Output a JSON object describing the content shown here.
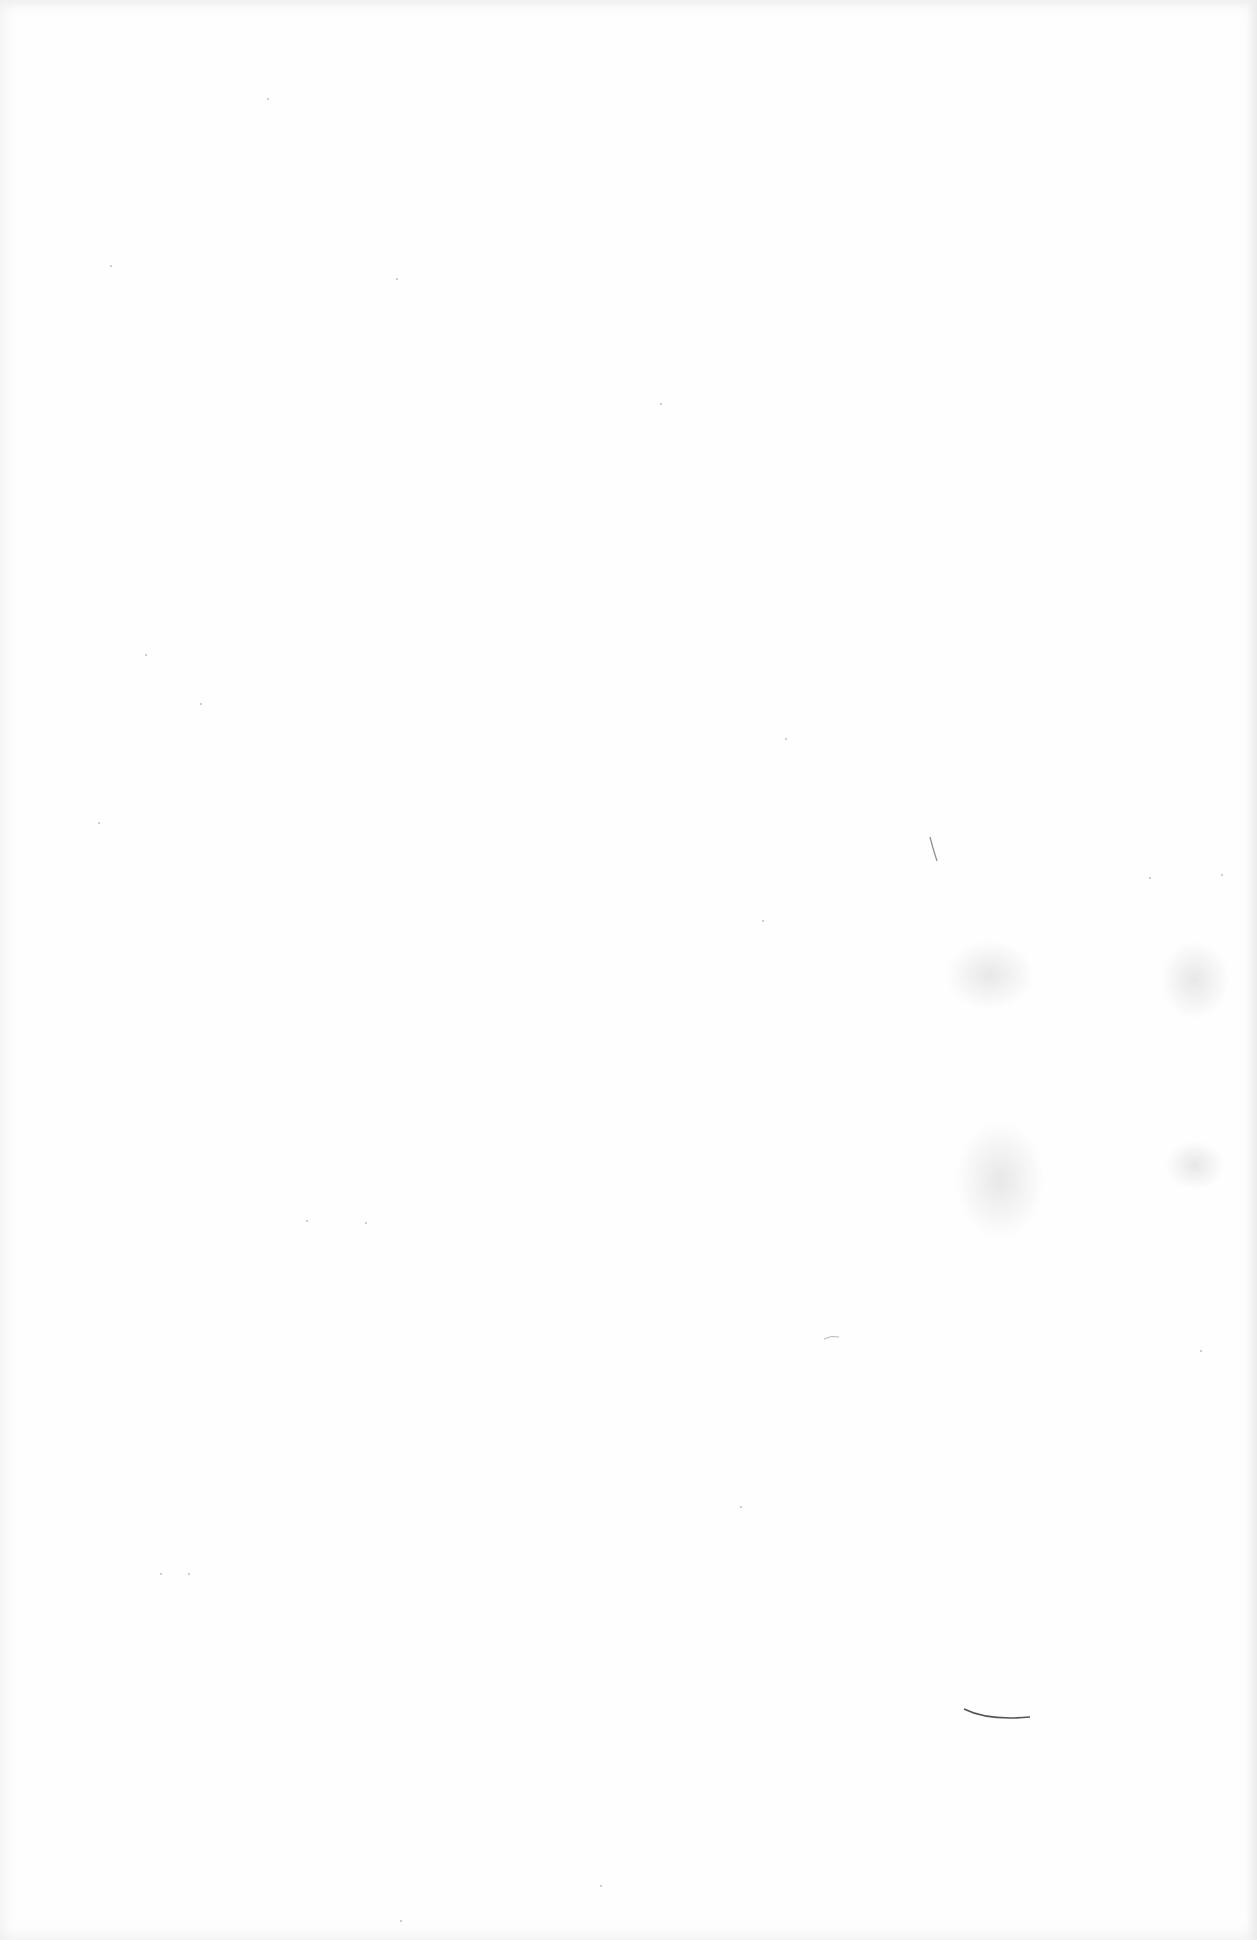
{
  "page": {
    "type": "blank scanned page",
    "background_color": "#fefefe",
    "text_content": ""
  },
  "marks": [
    {
      "kind": "stray-stroke",
      "x": 932,
      "y": 835
    },
    {
      "kind": "stray-curve",
      "x": 965,
      "y": 1710
    },
    {
      "kind": "stray-dash",
      "x": 825,
      "y": 1337
    }
  ]
}
